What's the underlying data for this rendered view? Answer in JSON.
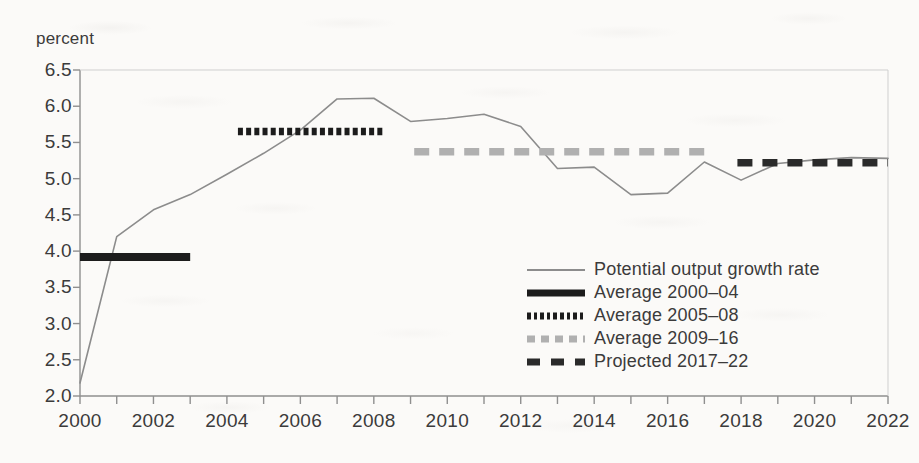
{
  "axis": {
    "y_title": "percent",
    "y_ticks": [
      "6.5",
      "6.0",
      "5.5",
      "5.0",
      "4.5",
      "4.0",
      "3.5",
      "3.0",
      "2.5",
      "2.0"
    ],
    "x_ticks": [
      "2000",
      "2002",
      "2004",
      "2006",
      "2008",
      "2010",
      "2012",
      "2014",
      "2016",
      "2018",
      "2020",
      "2022"
    ]
  },
  "legend": {
    "items": [
      {
        "label": "Potential output growth rate",
        "key": "thin-solid-gray-line",
        "color": "#8c8c8c"
      },
      {
        "label": "Average 2000–04",
        "key": "thick-solid-black-line",
        "color": "#1c1c1c"
      },
      {
        "label": "Average 2005–08",
        "key": "thick-dotted-black-line",
        "color": "#1c1c1c"
      },
      {
        "label": "Average 2009–16",
        "key": "thick-dashed-gray-line",
        "color": "#b0b0b0"
      },
      {
        "label": "Projected 2017–22",
        "key": "thick-dashed-black-line",
        "color": "#2a2a2a"
      }
    ]
  },
  "chart_data": {
    "type": "line",
    "title": "",
    "xlabel": "",
    "ylabel": "percent",
    "xlim": [
      2000,
      2022
    ],
    "ylim": [
      2.0,
      6.5
    ],
    "ytick_step": 0.5,
    "xtick_step": 1,
    "xtick_label_step": 2,
    "grid": false,
    "legend_position": "inside-lower-right",
    "x": [
      2000,
      2001,
      2002,
      2003,
      2004,
      2005,
      2006,
      2007,
      2008,
      2009,
      2010,
      2011,
      2012,
      2013,
      2014,
      2015,
      2016,
      2017,
      2018,
      2019,
      2020,
      2021,
      2022
    ],
    "series": [
      {
        "name": "Potential output growth rate",
        "style": "solid",
        "color": "#8c8c8c",
        "width": 1.6,
        "values": [
          2.18,
          4.2,
          4.57,
          4.78,
          5.06,
          5.35,
          5.67,
          6.1,
          6.11,
          5.79,
          5.83,
          5.89,
          5.72,
          5.14,
          5.16,
          4.78,
          4.8,
          5.23,
          4.98,
          5.21,
          5.26,
          5.29,
          5.28
        ]
      }
    ],
    "reference_segments": [
      {
        "name": "Average 2000–04",
        "style": "solid",
        "color": "#1c1c1c",
        "value": 3.92,
        "x_start": 2000,
        "x_end": 2003.0
      },
      {
        "name": "Average 2005–08",
        "style": "dotted",
        "color": "#1c1c1c",
        "value": 5.65,
        "x_start": 2004.3,
        "x_end": 2008.3
      },
      {
        "name": "Average 2009–16",
        "style": "dashed",
        "color": "#b0b0b0",
        "value": 5.37,
        "x_start": 2009.1,
        "x_end": 2017.1
      },
      {
        "name": "Projected 2017–22",
        "style": "dashed",
        "color": "#2a2a2a",
        "value": 5.22,
        "x_start": 2017.9,
        "x_end": 2022.0
      }
    ]
  }
}
